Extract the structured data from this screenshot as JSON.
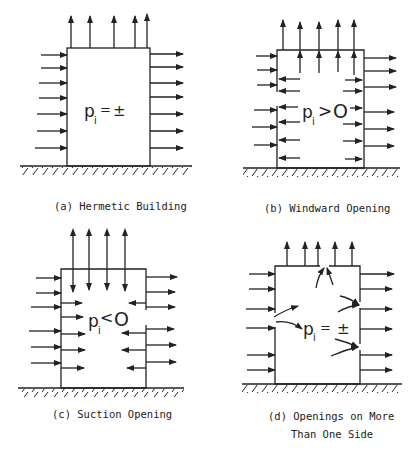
{
  "figure": {
    "panels": [
      {
        "id": "a",
        "caption": "(a) Hermetic Building",
        "pressure_label": {
          "p": "p",
          "sub": "i",
          "relation": "=",
          "value": "±"
        }
      },
      {
        "id": "b",
        "caption": "(b) Windward Opening",
        "pressure_label": {
          "p": "p",
          "sub": "i",
          "relation": ">",
          "value": "O"
        }
      },
      {
        "id": "c",
        "caption": "(c) Suction Opening",
        "pressure_label": {
          "p": "p",
          "sub": "i",
          "relation": "<",
          "value": "O"
        }
      },
      {
        "id": "d",
        "caption_line1": "(d) Openings on More",
        "caption_line2": "Than One Side",
        "pressure_label": {
          "p": "p",
          "sub": "i",
          "relation": "=",
          "value": "±"
        }
      }
    ],
    "colors": {
      "ink": "#222222",
      "background": "#ffffff"
    }
  }
}
